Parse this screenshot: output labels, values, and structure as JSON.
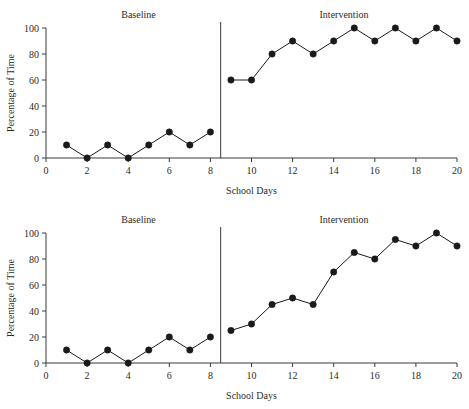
{
  "chart_data": [
    {
      "panel_id": "top",
      "type": "line",
      "title": "",
      "xlabel": "School Days",
      "ylabel": "Percentage of Time",
      "xlim": [
        0,
        20
      ],
      "ylim": [
        0,
        100
      ],
      "xticks": [
        0,
        2,
        4,
        6,
        8,
        10,
        12,
        14,
        16,
        18,
        20
      ],
      "xtick_labels": [
        "0",
        "2",
        "4",
        "6",
        "8",
        "10",
        "12",
        "14",
        "16",
        "18",
        "20"
      ],
      "yticks": [
        0,
        20,
        40,
        60,
        80,
        100
      ],
      "ytick_labels": [
        "0",
        "20",
        "40",
        "60",
        "80",
        "100"
      ],
      "grid": false,
      "legend": "none",
      "phase_line_x": 8.5,
      "annotations": [
        {
          "text": "Baseline",
          "x": 4.5,
          "y": 108
        },
        {
          "text": "Intervention",
          "x": 14.5,
          "y": 108
        }
      ],
      "series": [
        {
          "name": "Baseline",
          "x": [
            1,
            2,
            3,
            4,
            5,
            6,
            7,
            8
          ],
          "values": [
            10,
            0,
            10,
            0,
            10,
            20,
            10,
            20
          ]
        },
        {
          "name": "Intervention",
          "x": [
            9,
            10,
            11,
            12,
            13,
            14,
            15,
            16,
            17,
            18,
            19,
            20
          ],
          "values": [
            60,
            60,
            80,
            90,
            80,
            90,
            100,
            90,
            100,
            90,
            100,
            90
          ]
        }
      ]
    },
    {
      "panel_id": "bottom",
      "type": "line",
      "title": "",
      "xlabel": "School Days",
      "ylabel": "Percentage of Time",
      "xlim": [
        0,
        20
      ],
      "ylim": [
        0,
        100
      ],
      "xticks": [
        0,
        2,
        4,
        6,
        8,
        10,
        12,
        14,
        16,
        18,
        20
      ],
      "xtick_labels": [
        "0",
        "2",
        "4",
        "6",
        "8",
        "10",
        "12",
        "14",
        "16",
        "18",
        "20"
      ],
      "yticks": [
        0,
        20,
        40,
        60,
        80,
        100
      ],
      "ytick_labels": [
        "0",
        "20",
        "40",
        "60",
        "80",
        "100"
      ],
      "grid": false,
      "legend": "none",
      "phase_line_x": 8.5,
      "annotations": [
        {
          "text": "Baseline",
          "x": 4.5,
          "y": 108
        },
        {
          "text": "Intervention",
          "x": 14.5,
          "y": 108
        }
      ],
      "series": [
        {
          "name": "Baseline",
          "x": [
            1,
            2,
            3,
            4,
            5,
            6,
            7,
            8
          ],
          "values": [
            10,
            0,
            10,
            0,
            10,
            20,
            10,
            20
          ]
        },
        {
          "name": "Intervention",
          "x": [
            9,
            10,
            11,
            12,
            13,
            14,
            15,
            16,
            17,
            18,
            19,
            20
          ],
          "values": [
            25,
            30,
            45,
            50,
            45,
            70,
            85,
            80,
            95,
            90,
            100,
            90
          ]
        }
      ]
    }
  ],
  "style": {
    "line_color": "#1a1a1a",
    "marker_color": "#1a1a1a",
    "axis_color": "#3a3a3a",
    "background": "#ffffff"
  }
}
